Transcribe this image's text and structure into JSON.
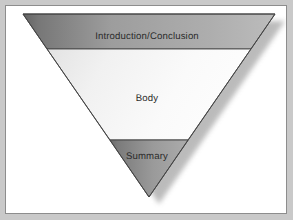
{
  "figure": {
    "name": "inverted-triangle-structure",
    "shape": "inverted-triangle",
    "background_color": "#c9c9c9",
    "canvas_color": "#ffffff",
    "border_color": "#8d8d8d",
    "outline_color": "#4a4a4a",
    "shadow_color": "#b4b4b4"
  },
  "bands": [
    {
      "id": "introduction-conclusion",
      "label": "Introduction/Conclusion",
      "gradient_from": "#6f6f6f",
      "gradient_to": "#b5b5b5",
      "text_color": "#2b2b2b"
    },
    {
      "id": "body",
      "label": "Body",
      "gradient_from": "#e8e8e8",
      "gradient_to": "#fbfbfb",
      "text_color": "#2b2b2b"
    },
    {
      "id": "summary",
      "label": "Summary",
      "gradient_from": "#737373",
      "gradient_to": "#a8a8a8",
      "text_color": "#2b2b2b"
    }
  ],
  "geometry": {
    "top_left_x": 17,
    "top_right_x": 269,
    "top_y": 8,
    "apex_x": 143,
    "apex_y": 191,
    "divider_1_y": 43,
    "divider_2_y": 134
  }
}
